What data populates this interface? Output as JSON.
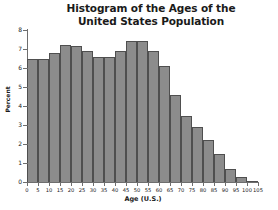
{
  "chart_data": {
    "type": "bar",
    "title": "Histogram of the Ages of the United States Population",
    "title_line1": "Histogram of the Ages of the",
    "title_line2": "United States Population",
    "xlabel": "Age (U.S.)",
    "ylabel": "Percent",
    "grid": false,
    "legend": "none",
    "bar_color": "#8c8c8c",
    "bar_edge_color": "#4f4f4f",
    "axis_color": "#6e6e6e",
    "background": "#ffffff",
    "xlim": [
      0,
      105
    ],
    "ylim": [
      0,
      8
    ],
    "bin_width": 5,
    "x_ticks": [
      0,
      5,
      10,
      15,
      20,
      25,
      30,
      35,
      40,
      45,
      50,
      55,
      60,
      65,
      70,
      75,
      80,
      85,
      90,
      95,
      100,
      105
    ],
    "x_tick_labels": [
      "0",
      "5",
      "10",
      "15",
      "20",
      "25",
      "30",
      "35",
      "40",
      "45",
      "50",
      "55",
      "60",
      "65",
      "70",
      "75",
      "80",
      "85",
      "90",
      "95",
      "100",
      "105"
    ],
    "y_ticks": [
      0,
      1,
      2,
      3,
      4,
      5,
      6,
      7,
      8
    ],
    "y_tick_labels": [
      "0",
      "1",
      "2",
      "3",
      "4",
      "5",
      "6",
      "7",
      "8"
    ],
    "categories": [
      "0-5",
      "5-10",
      "10-15",
      "15-20",
      "20-25",
      "25-30",
      "30-35",
      "35-40",
      "40-45",
      "45-50",
      "50-55",
      "55-60",
      "60-65",
      "65-70",
      "70-75",
      "75-80",
      "80-85",
      "85-90",
      "90-95",
      "95-100",
      "100-105"
    ],
    "values": [
      6.5,
      6.5,
      6.8,
      7.2,
      7.15,
      6.9,
      6.6,
      6.6,
      6.9,
      7.4,
      7.4,
      6.9,
      6.1,
      4.6,
      3.5,
      2.9,
      2.2,
      1.5,
      0.7,
      0.25,
      0.05
    ]
  }
}
